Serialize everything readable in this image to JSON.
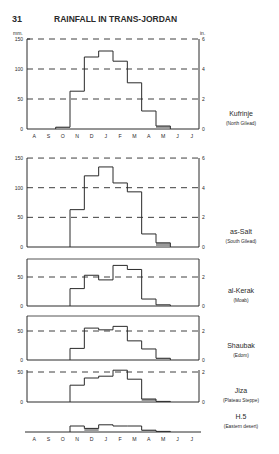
{
  "page": {
    "number": "31",
    "title": "RAINFALL IN TRANS-JORDAN",
    "left_unit": "mm.",
    "right_unit": "in."
  },
  "months": [
    "A",
    "S",
    "O",
    "N",
    "D",
    "J",
    "F",
    "M",
    "A",
    "M",
    "J",
    "J"
  ],
  "colors": {
    "ink": "#2a2a2a",
    "shade": "#9a9a9a",
    "background": "#ffffff"
  },
  "chart_data": [
    {
      "type": "bar",
      "title": "Kufrinje",
      "subtitle": "(North Gilead)",
      "categories": [
        "Aug",
        "Sep",
        "Oct",
        "Nov",
        "Dec",
        "Jan",
        "Feb",
        "Mar",
        "Apr",
        "May",
        "Jun",
        "Jul"
      ],
      "values": [
        0,
        0,
        3,
        63,
        120,
        130,
        113,
        77,
        30,
        5,
        0,
        0
      ],
      "ylabel": "mm.",
      "y2label": "in.",
      "ylim": [
        0,
        150
      ],
      "yticks": [
        0,
        50,
        100,
        150
      ],
      "y2ticks": [
        0,
        2,
        4,
        6
      ],
      "grid": "dashed"
    },
    {
      "type": "bar",
      "title": "as-Salt",
      "subtitle": "(South Gilead)",
      "categories": [
        "Aug",
        "Sep",
        "Oct",
        "Nov",
        "Dec",
        "Jan",
        "Feb",
        "Mar",
        "Apr",
        "May",
        "Jun",
        "Jul"
      ],
      "values": [
        0,
        0,
        0,
        63,
        120,
        135,
        108,
        93,
        22,
        7,
        0,
        0
      ],
      "ylim": [
        0,
        150
      ],
      "yticks": [
        0,
        50,
        100,
        150
      ],
      "y2ticks": [
        0,
        2,
        4,
        6
      ],
      "grid": "dashed"
    },
    {
      "type": "bar",
      "title": "al-Kerak",
      "subtitle": "(Moab)",
      "categories": [
        "Aug",
        "Sep",
        "Oct",
        "Nov",
        "Dec",
        "Jan",
        "Feb",
        "Mar",
        "Apr",
        "May",
        "Jun",
        "Jul"
      ],
      "values": [
        0,
        0,
        0,
        30,
        53,
        45,
        70,
        63,
        12,
        2,
        0,
        0
      ],
      "ylim": [
        0,
        80
      ],
      "yticks": [
        0,
        50
      ],
      "y2ticks": [
        0,
        2
      ],
      "grid": "dashed"
    },
    {
      "type": "bar",
      "title": "Shaubak",
      "subtitle": "(Edom)",
      "categories": [
        "Aug",
        "Sep",
        "Oct",
        "Nov",
        "Dec",
        "Jan",
        "Feb",
        "Mar",
        "Apr",
        "May",
        "Jun",
        "Jul"
      ],
      "values": [
        0,
        0,
        0,
        20,
        55,
        52,
        58,
        33,
        19,
        3,
        0,
        0
      ],
      "ylim": [
        0,
        75
      ],
      "yticks": [
        0,
        50
      ],
      "y2ticks": [
        0,
        2
      ],
      "grid": "dashed"
    },
    {
      "type": "bar",
      "title": "Jiza",
      "subtitle": "(Plateau Steppe)",
      "categories": [
        "Aug",
        "Sep",
        "Oct",
        "Nov",
        "Dec",
        "Jan",
        "Feb",
        "Mar",
        "Apr",
        "May",
        "Jun",
        "Jul"
      ],
      "values": [
        0,
        0,
        0,
        28,
        40,
        43,
        53,
        38,
        5,
        1,
        0,
        0
      ],
      "ylim": [
        0,
        55
      ],
      "yticks": [
        0,
        50
      ],
      "y2ticks": [
        0,
        2
      ],
      "grid": "dashed"
    },
    {
      "type": "bar",
      "title": "H.5",
      "subtitle": "(Eastern desert)",
      "categories": [
        "Aug",
        "Sep",
        "Oct",
        "Nov",
        "Dec",
        "Jan",
        "Feb",
        "Mar",
        "Apr",
        "May",
        "Jun",
        "Jul"
      ],
      "values": [
        0,
        0,
        0,
        10,
        6,
        12,
        10,
        10,
        3,
        1,
        0,
        0
      ],
      "ylim": [
        0,
        15
      ],
      "yticks": [],
      "y2ticks": [],
      "grid": "none"
    }
  ]
}
